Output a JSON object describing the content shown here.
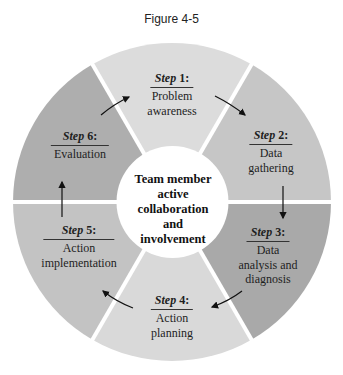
{
  "figure_title": "Figure 4-5",
  "center": {
    "lines": [
      "Team member",
      "active",
      "collaboration",
      "and",
      "involvement"
    ]
  },
  "steps": [
    {
      "word": "Step",
      "num": "1:",
      "lines": [
        "Problem",
        "awareness"
      ],
      "color": "#dcdcdc"
    },
    {
      "word": "Step",
      "num": "2:",
      "lines": [
        "Data",
        "gathering"
      ],
      "color": "#c6c6c6"
    },
    {
      "word": "Step",
      "num": "3:",
      "lines": [
        "Data",
        "analysis and",
        "diagnosis"
      ],
      "color": "#a9a9a9"
    },
    {
      "word": "Step",
      "num": "4:",
      "lines": [
        "Action",
        "planning"
      ],
      "color": "#d9d9d9"
    },
    {
      "word": "Step",
      "num": "5:",
      "lines": [
        "Action",
        "implementation"
      ],
      "color": "#c3c3c3"
    },
    {
      "word": "Step",
      "num": "6:",
      "lines": [
        "Evaluation"
      ],
      "color": "#aeaeae"
    }
  ],
  "cycle_direction": "clockwise"
}
